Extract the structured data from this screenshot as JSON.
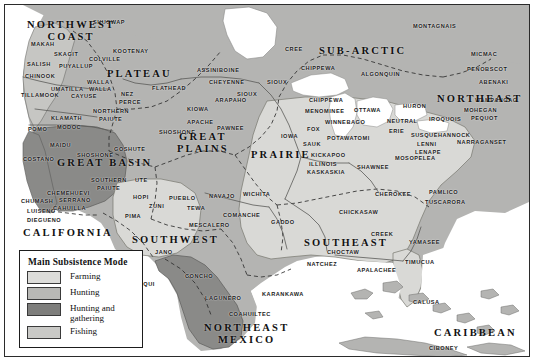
{
  "map": {
    "title": "Native American Culture Areas",
    "colors": {
      "farming": "#d9d9d6",
      "hunting": "#b4b4b2",
      "hunting_and_gathering": "#8a8a88",
      "fishing": "#c6c6c3",
      "water": "#ffffff",
      "border_line": "#5a5a58",
      "dashed_line": "#2e2e2e",
      "frame": "#2b2b2b"
    },
    "culture_areas": [
      {
        "name": "NORTHWEST COAST",
        "x": 18,
        "y": 10,
        "lines": [
          "NORTHWEST",
          "COAST"
        ]
      },
      {
        "name": "PLATEAU",
        "x": 98,
        "y": 59
      },
      {
        "name": "GREAT BASIN",
        "x": 48,
        "y": 148
      },
      {
        "name": "CALIFORNIA",
        "x": 14,
        "y": 218
      },
      {
        "name": "SOUTHWEST",
        "x": 123,
        "y": 225
      },
      {
        "name": "GREAT PLAINS",
        "x": 168,
        "y": 122,
        "lines": [
          "GREAT",
          "PLAINS"
        ]
      },
      {
        "name": "PRAIRIE",
        "x": 242,
        "y": 140
      },
      {
        "name": "SUB-ARCTIC",
        "x": 310,
        "y": 36
      },
      {
        "name": "NORTHEAST",
        "x": 428,
        "y": 84,
        "lines": [
          "NORTHEAST"
        ]
      },
      {
        "name": "SOUTHEAST",
        "x": 295,
        "y": 228
      },
      {
        "name": "NORTHEAST MEXICO",
        "x": 195,
        "y": 313,
        "lines": [
          "NORTHEAST",
          "MEXICO"
        ]
      },
      {
        "name": "CARIBBEAN",
        "x": 425,
        "y": 318
      }
    ],
    "tribes": [
      {
        "label": "SHUSWAP",
        "x": 84,
        "y": 10
      },
      {
        "label": "MAKAH",
        "x": 22,
        "y": 32
      },
      {
        "label": "SKAGIT",
        "x": 45,
        "y": 42
      },
      {
        "label": "COLVILLE",
        "x": 80,
        "y": 47
      },
      {
        "label": "KOOTENAY",
        "x": 104,
        "y": 39
      },
      {
        "label": "SALISH",
        "x": 18,
        "y": 52
      },
      {
        "label": "PUYALLUP",
        "x": 50,
        "y": 54
      },
      {
        "label": "CHINOOK",
        "x": 16,
        "y": 64
      },
      {
        "label": "WALLA",
        "x": 78,
        "y": 70
      },
      {
        "label": "UMATILLA",
        "x": 42,
        "y": 77
      },
      {
        "label": "WALLA",
        "x": 80,
        "y": 77
      },
      {
        "label": "TILLAMOOK",
        "x": 12,
        "y": 83
      },
      {
        "label": "CAYUSE",
        "x": 62,
        "y": 84
      },
      {
        "label": "NEZ",
        "x": 112,
        "y": 82
      },
      {
        "label": "PERCE",
        "x": 110,
        "y": 90
      },
      {
        "label": "FLATHEAD",
        "x": 143,
        "y": 76
      },
      {
        "label": "NORTHERN",
        "x": 84,
        "y": 99
      },
      {
        "label": "PAIUTE",
        "x": 90,
        "y": 107
      },
      {
        "label": "KLAMATH",
        "x": 42,
        "y": 106
      },
      {
        "label": "MODOC",
        "x": 48,
        "y": 115
      },
      {
        "label": "POMO",
        "x": 19,
        "y": 117
      },
      {
        "label": "SHOSHONE",
        "x": 150,
        "y": 120
      },
      {
        "label": "APACHE",
        "x": 178,
        "y": 110
      },
      {
        "label": "GOSHUTE",
        "x": 105,
        "y": 137
      },
      {
        "label": "MAIDU",
        "x": 41,
        "y": 133
      },
      {
        "label": "SHOSHONE",
        "x": 68,
        "y": 143
      },
      {
        "label": "COSTANO",
        "x": 14,
        "y": 147
      },
      {
        "label": "SOUTHERN",
        "x": 82,
        "y": 168
      },
      {
        "label": "PAIUTE",
        "x": 88,
        "y": 176
      },
      {
        "label": "UTE",
        "x": 126,
        "y": 168
      },
      {
        "label": "CHEMEHUEVI",
        "x": 38,
        "y": 181
      },
      {
        "label": "CHUMASH",
        "x": 12,
        "y": 189
      },
      {
        "label": "SERRANO",
        "x": 50,
        "y": 188
      },
      {
        "label": "HOPI",
        "x": 124,
        "y": 185
      },
      {
        "label": "PUEBLO",
        "x": 160,
        "y": 186
      },
      {
        "label": "NAVAJO",
        "x": 200,
        "y": 184
      },
      {
        "label": "LUISENO",
        "x": 18,
        "y": 199
      },
      {
        "label": "CAHUILLA",
        "x": 44,
        "y": 196
      },
      {
        "label": "ZUNI",
        "x": 140,
        "y": 194
      },
      {
        "label": "TEWA",
        "x": 178,
        "y": 196
      },
      {
        "label": "DIEGUENO",
        "x": 18,
        "y": 208
      },
      {
        "label": "PIMA",
        "x": 116,
        "y": 204
      },
      {
        "label": "MESCALERO",
        "x": 180,
        "y": 213
      },
      {
        "label": "JANO",
        "x": 146,
        "y": 240
      },
      {
        "label": "YAQUI",
        "x": 126,
        "y": 272
      },
      {
        "label": "CONCHO",
        "x": 176,
        "y": 264
      },
      {
        "label": "LAGUNERO",
        "x": 196,
        "y": 286
      },
      {
        "label": "COAHUILTEC",
        "x": 220,
        "y": 302
      },
      {
        "label": "KARANKAWA",
        "x": 253,
        "y": 282
      },
      {
        "label": "ASSINIBOINE",
        "x": 188,
        "y": 58
      },
      {
        "label": "CREE",
        "x": 276,
        "y": 37
      },
      {
        "label": "CHEYENNE",
        "x": 200,
        "y": 70
      },
      {
        "label": "SIOUX",
        "x": 258,
        "y": 70
      },
      {
        "label": "CHIPPEWA",
        "x": 292,
        "y": 56
      },
      {
        "label": "ALGONQUIN",
        "x": 352,
        "y": 62
      },
      {
        "label": "MONTAGNAIS",
        "x": 404,
        "y": 14
      },
      {
        "label": "MICMAC",
        "x": 462,
        "y": 42
      },
      {
        "label": "PENOBSCOT",
        "x": 458,
        "y": 57
      },
      {
        "label": "ABENAKI",
        "x": 470,
        "y": 70
      },
      {
        "label": "SIOUX",
        "x": 228,
        "y": 82
      },
      {
        "label": "ARAPAHO",
        "x": 206,
        "y": 88
      },
      {
        "label": "KIOWA",
        "x": 178,
        "y": 97
      },
      {
        "label": "CHIPPEWA",
        "x": 300,
        "y": 88
      },
      {
        "label": "MENOMINEE",
        "x": 296,
        "y": 99
      },
      {
        "label": "OTTAWA",
        "x": 345,
        "y": 98
      },
      {
        "label": "HURON",
        "x": 394,
        "y": 94
      },
      {
        "label": "NEUTRAL",
        "x": 378,
        "y": 109
      },
      {
        "label": "ERIE",
        "x": 380,
        "y": 119
      },
      {
        "label": "IROQUOIS",
        "x": 420,
        "y": 107
      },
      {
        "label": "MOHEGAN",
        "x": 455,
        "y": 98
      },
      {
        "label": "PEQUOT",
        "x": 462,
        "y": 106
      },
      {
        "label": "WAMPANOAG",
        "x": 466,
        "y": 88
      },
      {
        "label": "PAWNEE",
        "x": 208,
        "y": 116
      },
      {
        "label": "IOWA",
        "x": 272,
        "y": 124
      },
      {
        "label": "FOX",
        "x": 298,
        "y": 117
      },
      {
        "label": "WINNEBAGO",
        "x": 316,
        "y": 110
      },
      {
        "label": "SAUK",
        "x": 294,
        "y": 132
      },
      {
        "label": "POTAWATOMI",
        "x": 318,
        "y": 126
      },
      {
        "label": "KICKAPOO",
        "x": 302,
        "y": 143
      },
      {
        "label": "ILLINOIS",
        "x": 300,
        "y": 152
      },
      {
        "label": "KASKASKIA",
        "x": 298,
        "y": 160
      },
      {
        "label": "SHAWNEE",
        "x": 348,
        "y": 155
      },
      {
        "label": "SUSQUEHANNOCK",
        "x": 402,
        "y": 123
      },
      {
        "label": "LENNI",
        "x": 408,
        "y": 132
      },
      {
        "label": "LENAPE",
        "x": 406,
        "y": 140
      },
      {
        "label": "NARRAGANSET",
        "x": 448,
        "y": 130
      },
      {
        "label": "MOSOPELEA",
        "x": 386,
        "y": 146
      },
      {
        "label": "WICHITA",
        "x": 234,
        "y": 182
      },
      {
        "label": "COMANCHE",
        "x": 214,
        "y": 203
      },
      {
        "label": "GADDO",
        "x": 262,
        "y": 210
      },
      {
        "label": "CHEROKEE",
        "x": 366,
        "y": 182
      },
      {
        "label": "PAMLICO",
        "x": 420,
        "y": 180
      },
      {
        "label": "TUSCARORA",
        "x": 416,
        "y": 190
      },
      {
        "label": "CHICKASAW",
        "x": 330,
        "y": 200
      },
      {
        "label": "CHOCTAW",
        "x": 318,
        "y": 240
      },
      {
        "label": "NATCHEZ",
        "x": 298,
        "y": 252
      },
      {
        "label": "APALACHEE",
        "x": 348,
        "y": 258
      },
      {
        "label": "CREEK",
        "x": 362,
        "y": 222
      },
      {
        "label": "YAMASEE",
        "x": 400,
        "y": 230
      },
      {
        "label": "TIMUCUA",
        "x": 396,
        "y": 250
      },
      {
        "label": "CALUSA",
        "x": 404,
        "y": 290
      },
      {
        "label": "CIBONEY",
        "x": 420,
        "y": 336
      }
    ]
  },
  "legend": {
    "title": "Main Subsistence Mode",
    "items": [
      {
        "label": "Farming",
        "color": "#dcdcd9"
      },
      {
        "label": "Hunting",
        "color": "#b8b8b5"
      },
      {
        "label": "Hunting and gathering",
        "color": "#7e7e7c"
      },
      {
        "label": "Fishing",
        "color": "#c9c9c6"
      }
    ]
  }
}
